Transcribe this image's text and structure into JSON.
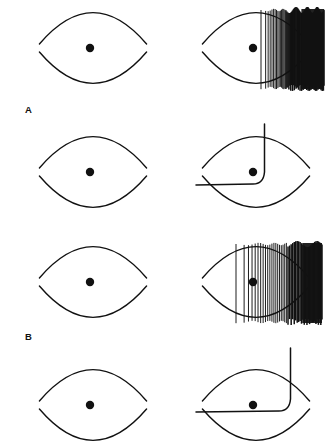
{
  "figure": {
    "background_color": "#ffffff",
    "ink_color": "#111111",
    "width": 332,
    "height": 447,
    "group_labels": [
      {
        "name": "group-label-a",
        "text": "A",
        "x": 25,
        "y": 113
      },
      {
        "name": "group-label-b",
        "text": "B",
        "x": 25,
        "y": 340
      }
    ],
    "columns": {
      "left": {
        "label": "stimulus-panel",
        "center_x": 93
      },
      "right": {
        "label": "response-panel",
        "center_x": 256
      }
    },
    "rows": [
      {
        "id": "row-1",
        "group": "A",
        "center_y": 48,
        "response_type": "spike-train",
        "spikes": {
          "start_x": 261,
          "end_x": 324,
          "top_y": 10,
          "bottom_y": 88,
          "count": 68,
          "dense_from_x": 285,
          "description": "burst of action potentials beginning just right of center, saturating into a solid black block"
        }
      },
      {
        "id": "row-2",
        "group": "A",
        "center_y": 172,
        "response_type": "step-trace",
        "trace": {
          "baseline_y": 185,
          "baseline_start_x": 196,
          "corner_x": 262,
          "rise_top_y": 124,
          "description": "flat baseline from left that bends sharply upward at the dot and rises vertically off the top of the panel"
        }
      },
      {
        "id": "row-3",
        "group": "B",
        "center_y": 282,
        "response_type": "spike-train",
        "spikes": {
          "start_x": 236,
          "end_x": 322,
          "top_y": 244,
          "bottom_y": 322,
          "count": 46,
          "dense_from_x": 288,
          "description": "sustained regularly spaced spikes beginning left of center, becoming saturated at the right"
        }
      },
      {
        "id": "row-4",
        "group": "B",
        "center_y": 405,
        "response_type": "step-trace",
        "trace": {
          "baseline_y": 412,
          "baseline_start_x": 196,
          "corner_x": 288,
          "rise_top_y": 348,
          "description": "shallow rising baseline passing above the dot then turning sharply upward off the top of the panel"
        }
      }
    ],
    "eye_shape": {
      "name": "lens-outline",
      "half_width": 57,
      "half_height": 33,
      "dot_radius": 4.2,
      "dot_offset_x": -3,
      "stroke_width": 1.4,
      "description": "two opposing arcs forming a pointed ellipse (lens/eye outline) with a filled circular dot near the center"
    }
  }
}
